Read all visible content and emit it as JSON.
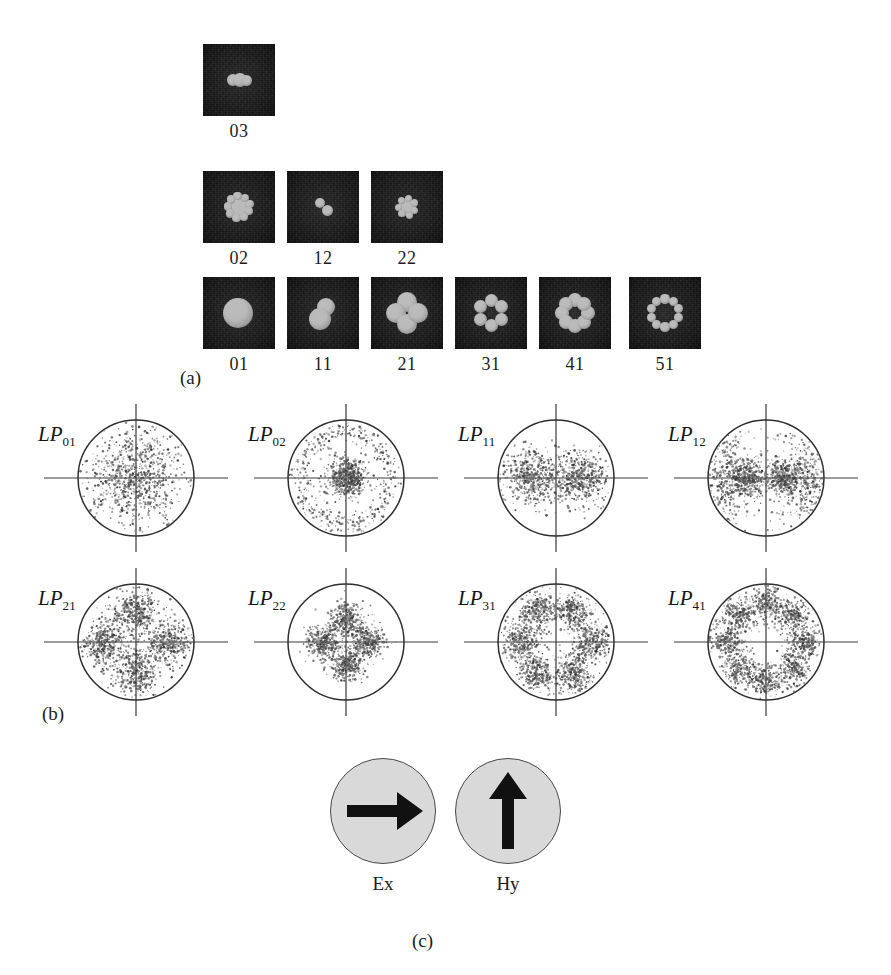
{
  "figure": {
    "panels": [
      {
        "id": "a",
        "label": "(a)"
      },
      {
        "id": "b",
        "label": "(b)"
      },
      {
        "id": "c",
        "label": "(c)"
      }
    ]
  },
  "panel_a": {
    "title": "near-field mode intensity photographs",
    "rows": [
      {
        "row": 1,
        "cells": [
          {
            "caption": "03",
            "lobes": 3,
            "pattern": "horizontal-triple",
            "x": 203,
            "y": 44
          }
        ]
      },
      {
        "row": 2,
        "cells": [
          {
            "caption": "02",
            "lobes": 1,
            "pattern": "ring",
            "x": 203,
            "y": 171
          },
          {
            "caption": "12",
            "lobes": 2,
            "pattern": "diagonal-pair",
            "x": 287,
            "y": 171
          },
          {
            "caption": "22",
            "lobes": 1,
            "pattern": "small-ring",
            "x": 371,
            "y": 171
          }
        ]
      },
      {
        "row": 3,
        "cells": [
          {
            "caption": "01",
            "lobes": 1,
            "pattern": "single-spot",
            "x": 203,
            "y": 277
          },
          {
            "caption": "11",
            "lobes": 2,
            "pattern": "two-lobe",
            "x": 287,
            "y": 277
          },
          {
            "caption": "21",
            "lobes": 4,
            "pattern": "four-lobe",
            "x": 371,
            "y": 277
          },
          {
            "caption": "31",
            "lobes": 6,
            "pattern": "six-lobe",
            "x": 455,
            "y": 277
          },
          {
            "caption": "41",
            "lobes": 8,
            "pattern": "eight-lobe",
            "x": 539,
            "y": 277
          },
          {
            "caption": "51",
            "lobes": 10,
            "pattern": "ten-lobe",
            "x": 629,
            "y": 277
          }
        ]
      }
    ]
  },
  "panel_b": {
    "title": "far-field speckle distributions with crosshair axes",
    "cells": [
      {
        "label_prefix": "LP",
        "label_sub": "01",
        "lobes": 1,
        "pattern": "central-blob",
        "x": 34,
        "y": 8
      },
      {
        "label_prefix": "LP",
        "label_sub": "02",
        "lobes": 1,
        "pattern": "core-plus-ring",
        "x": 244,
        "y": 8
      },
      {
        "label_prefix": "LP",
        "label_sub": "11",
        "lobes": 2,
        "pattern": "two-lobe-horizontal",
        "x": 454,
        "y": 8
      },
      {
        "label_prefix": "LP",
        "label_sub": "12",
        "lobes": 2,
        "pattern": "two-lobe-plus-arcs",
        "x": 664,
        "y": 8
      },
      {
        "label_prefix": "LP",
        "label_sub": "21",
        "lobes": 4,
        "pattern": "four-lobe-cross",
        "x": 34,
        "y": 172
      },
      {
        "label_prefix": "LP",
        "label_sub": "22",
        "lobes": 4,
        "pattern": "four-lobe-inner",
        "x": 244,
        "y": 172
      },
      {
        "label_prefix": "LP",
        "label_sub": "31",
        "lobes": 6,
        "pattern": "six-lobe",
        "x": 454,
        "y": 172
      },
      {
        "label_prefix": "LP",
        "label_sub": "41",
        "lobes": 8,
        "pattern": "eight-lobe",
        "x": 664,
        "y": 172
      }
    ]
  },
  "panel_c": {
    "title": "field polarization direction diagrams",
    "cells": [
      {
        "caption": "Ex",
        "arrow": "right-arrow-icon",
        "direction": "right",
        "x": 330,
        "y": 18
      },
      {
        "caption": "Hy",
        "arrow": "up-arrow-icon",
        "direction": "up",
        "x": 455,
        "y": 18
      }
    ],
    "circle_fill": "#d9d9d9",
    "arrow_color": "#111111"
  }
}
